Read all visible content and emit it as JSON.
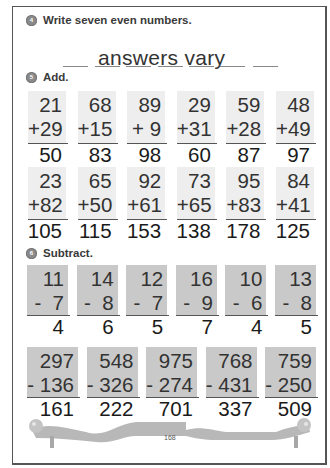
{
  "page": {
    "number": "168"
  },
  "section4": {
    "badge": "4",
    "title": "Write seven even numbers.",
    "answer": "answers vary",
    "blank_count": 7
  },
  "section5": {
    "badge": "5",
    "title": "Add.",
    "rows": [
      [
        {
          "top": "21",
          "bottom": "+29",
          "answer": "50"
        },
        {
          "top": "68",
          "bottom": "+15",
          "answer": "83"
        },
        {
          "top": "89",
          "bottom": "+ 9",
          "answer": "98"
        },
        {
          "top": "29",
          "bottom": "+31",
          "answer": "60"
        },
        {
          "top": "59",
          "bottom": "+28",
          "answer": "87"
        },
        {
          "top": "48",
          "bottom": "+49",
          "answer": "97"
        }
      ],
      [
        {
          "top": "23",
          "bottom": "+82",
          "answer": "105"
        },
        {
          "top": "65",
          "bottom": "+50",
          "answer": "115"
        },
        {
          "top": "92",
          "bottom": "+61",
          "answer": "153"
        },
        {
          "top": "73",
          "bottom": "+65",
          "answer": "138"
        },
        {
          "top": "95",
          "bottom": "+83",
          "answer": "178"
        },
        {
          "top": "84",
          "bottom": "+41",
          "answer": "125"
        }
      ]
    ]
  },
  "section6": {
    "badge": "6",
    "title": "Subtract.",
    "rows": [
      [
        {
          "top": "11",
          "bottom": "-  7",
          "answer": "4"
        },
        {
          "top": "14",
          "bottom": "-  8",
          "answer": "6"
        },
        {
          "top": "12",
          "bottom": "-  7",
          "answer": "5"
        },
        {
          "top": "16",
          "bottom": "-  9",
          "answer": "7"
        },
        {
          "top": "10",
          "bottom": "-  6",
          "answer": "4"
        },
        {
          "top": "13",
          "bottom": "-  8",
          "answer": "5"
        }
      ],
      [
        {
          "top": "297",
          "bottom": "- 136",
          "answer": "161"
        },
        {
          "top": "548",
          "bottom": "- 326",
          "answer": "222"
        },
        {
          "top": "975",
          "bottom": "- 274",
          "answer": "701"
        },
        {
          "top": "768",
          "bottom": "- 431",
          "answer": "337"
        },
        {
          "top": "759",
          "bottom": "- 250",
          "answer": "509"
        }
      ]
    ]
  },
  "colors": {
    "add_box": "#eeeeee",
    "sub_box": "#c9c9c9",
    "badge": "#8a8a8a",
    "ribbon": "#b5b5b5"
  }
}
